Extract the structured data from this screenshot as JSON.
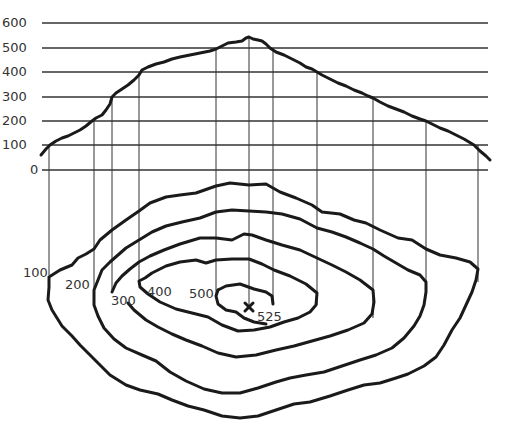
{
  "diagram": {
    "profile": {
      "y_axis_labels": [
        "600",
        "500",
        "400",
        "300",
        "200",
        "100",
        "0"
      ]
    },
    "contour_map": {
      "contour_labels": [
        "100",
        "200",
        "300",
        "400",
        "500"
      ],
      "summit_marker": "×",
      "summit_label": "525"
    },
    "colors": {
      "line": "#1a1a1a",
      "grid": "#333333",
      "background": "#ffffff"
    }
  }
}
